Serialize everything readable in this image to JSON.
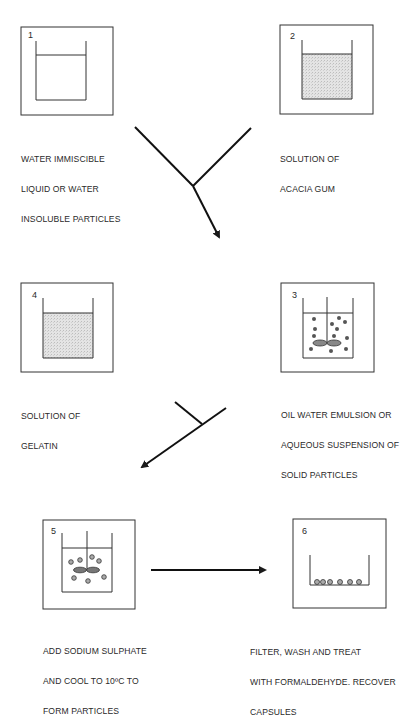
{
  "diagram": {
    "title": "",
    "colors": {
      "line": "#1a1a1a",
      "fill": "#d9d9d9",
      "text": "#2a2a2a",
      "particle": "#555555"
    },
    "steps": [
      {
        "number": "1",
        "caption": [
          "WATER IMMISCIBLE",
          "LIQUID OR WATER",
          "INSOLUBLE PARTICLES"
        ],
        "vessel": "beaker-empty-liquid"
      },
      {
        "number": "2",
        "caption": [
          "SOLUTION OF",
          "ACACIA GUM"
        ],
        "vessel": "beaker-shaded-liquid"
      },
      {
        "number": "3",
        "caption": [
          "OIL WATER EMULSION OR",
          "AQUEOUS SUSPENSION OF",
          "SOLID PARTICLES"
        ],
        "vessel": "beaker-with-stirrer-and-particles"
      },
      {
        "number": "4",
        "caption": [
          "SOLUTION OF",
          "GELATIN"
        ],
        "vessel": "beaker-shaded-liquid"
      },
      {
        "number": "5",
        "caption": [
          "ADD SODIUM SULPHATE",
          "AND COOL TO 10ºC TO",
          "FORM PARTICLES"
        ],
        "vessel": "beaker-with-stirrer-and-particles"
      },
      {
        "number": "6",
        "caption": [
          "FILTER, WASH AND TREAT",
          "WITH FORMALDEHYDE. RECOVER",
          "CAPSULES"
        ],
        "vessel": "filter-with-capsules"
      }
    ],
    "arrows": [
      {
        "from": [
          "1",
          "2"
        ],
        "to": "3",
        "type": "merge"
      },
      {
        "from": [
          "4",
          "3"
        ],
        "to": "5",
        "type": "merge"
      },
      {
        "from": [
          "5"
        ],
        "to": "6",
        "type": "straight"
      }
    ]
  }
}
